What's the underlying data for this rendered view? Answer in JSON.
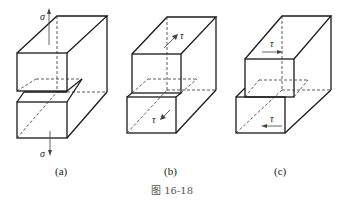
{
  "caption": "图 16-18",
  "figures": [
    {
      "id": "a",
      "label": "(a)",
      "description": "Block cut into two parts under normal stress sigma (tension), separation opening",
      "stress_symbol": "σ",
      "stress_top_label": "σ",
      "stress_bottom_label": "σ"
    },
    {
      "id": "b",
      "label": "(b)",
      "description": "Block with shear stress tau along depth direction (out-of-plane sliding)",
      "stress_symbol": "τ",
      "stress_top_label": "τ",
      "stress_bottom_label": "τ"
    },
    {
      "id": "c",
      "label": "(c)",
      "description": "Block with shear stress tau along width direction (in-plane sliding)",
      "stress_symbol": "τ",
      "stress_top_label": "τ",
      "stress_bottom_label": "τ"
    }
  ],
  "colors": {
    "line": "#1a1a1a",
    "background": "#ffffff",
    "caption": "#555555"
  }
}
